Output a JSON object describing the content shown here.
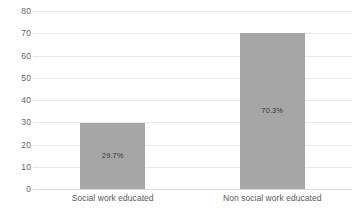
{
  "chart_data": {
    "type": "bar",
    "title": "",
    "subtitle": "",
    "xlabel": "",
    "ylabel": "",
    "categories": [
      "Social work educated",
      "Non social work educated"
    ],
    "values": [
      29.7,
      70.3
    ],
    "data_labels": [
      "29.7%",
      "70.3%"
    ],
    "ylim": [
      0,
      80
    ],
    "ytick_step": 10,
    "yticks": [
      "80",
      "70",
      "60",
      "50",
      "40",
      "30",
      "20",
      "10",
      "0"
    ],
    "ytick_values": [
      80,
      70,
      60,
      50,
      40,
      30,
      20,
      10,
      0
    ],
    "grid": true,
    "grid_axis": "y",
    "legend": false,
    "legend_position": "none",
    "colors": {
      "bar": "#a6a6a6",
      "gridline": "#e8e8e8",
      "baseline": "#dcdcdc",
      "tick_text": "#666666",
      "category_text": "#595959",
      "data_label_text": "#3a3a3a",
      "background": "#ffffff"
    }
  }
}
